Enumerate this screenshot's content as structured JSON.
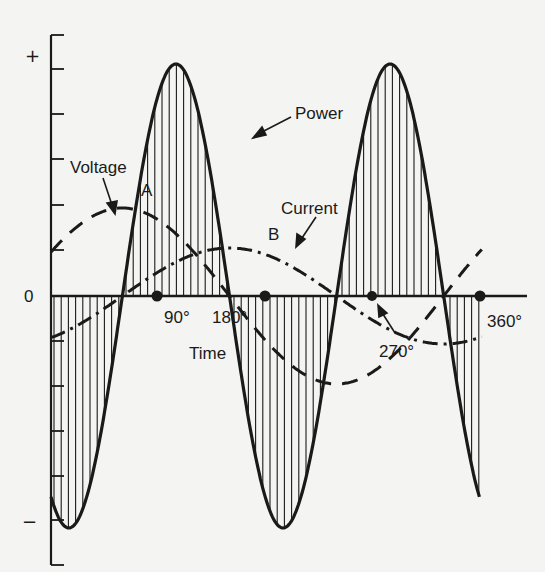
{
  "chart_data": {
    "type": "line",
    "title": "",
    "xlabel": "Time",
    "ylabel": "",
    "x_ticks": [
      "90°",
      "180°",
      "270°",
      "360°"
    ],
    "x_degrees": [
      0,
      90,
      180,
      270,
      360
    ],
    "y_ticks": [
      "+",
      "0",
      "−"
    ],
    "y_tick_count": 13,
    "series": [
      {
        "name": "Voltage",
        "style": "dashed",
        "formula": "0.4 * sin(theta + 30deg)",
        "x_degrees": [
          0,
          60,
          150,
          240,
          330,
          360
        ],
        "values": [
          0.2,
          0.4,
          0.0,
          -0.4,
          0.0,
          0.2
        ]
      },
      {
        "name": "Current",
        "style": "dash-dot",
        "formula": "-0.2 * cos(theta + 30deg)",
        "x_degrees": [
          0,
          60,
          150,
          240,
          330,
          360
        ],
        "values": [
          -0.17,
          0.0,
          0.2,
          0.0,
          -0.2,
          -0.17
        ]
      },
      {
        "name": "Power",
        "style": "solid-shaded",
        "formula": "-sin(2*(theta+30deg))",
        "x_degrees": [
          0,
          45,
          90,
          135,
          180,
          225,
          270,
          315,
          360
        ],
        "values": [
          -0.87,
          -0.97,
          0.0,
          1.0,
          0.0,
          -1.0,
          0.0,
          1.0,
          -0.87
        ]
      }
    ],
    "points": [
      {
        "label": "A",
        "note": "voltage peak"
      },
      {
        "label": "B",
        "note": "current peak"
      }
    ],
    "marked_crossings_degrees": [
      90,
      180,
      270,
      360
    ]
  },
  "labels": {
    "plus": "+",
    "zero": "0",
    "minus": "−",
    "voltage": "Voltage",
    "current": "Current",
    "power": "Power",
    "point_a": "A",
    "point_b": "B",
    "deg90": "90°",
    "deg180": "180°",
    "deg270": "270°",
    "deg360": "360°",
    "time": "Time"
  },
  "geometry": {
    "axis_x": 51,
    "zero_y": 296,
    "px_per_degree": 1.19,
    "power_amp_px": 232,
    "voltage_amp_px": 88,
    "current_amp_px": 48
  },
  "colors": {
    "ink": "#1a1a1a",
    "paper": "#f4f4f2"
  }
}
